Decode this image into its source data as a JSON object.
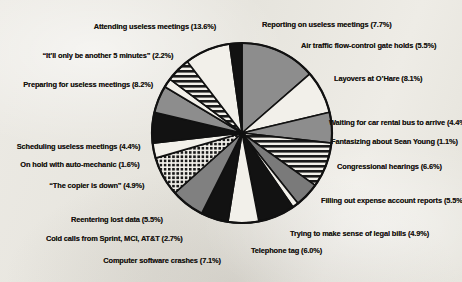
{
  "chart_data": {
    "type": "pie",
    "title": "",
    "subtitle": "",
    "xlabel": "",
    "ylabel": "",
    "legend_position": "radial-callout-labels",
    "grid": false,
    "units": "percent",
    "total": 100.0,
    "categories": [
      "Attending useless meetings",
      "Reporting on useless meetings",
      "Air traffic flow-control gate holds",
      "Layovers at O'Hare",
      "Waiting for car rental bus to arrive",
      "Fantasizing about Sean Young",
      "Congressional hearings",
      "Filling out expense account reports",
      "Trying to make sense of legal bills",
      "Telephone tag",
      "Computer software crashes",
      "Cold calls from Sprint, MCI, AT&T",
      "Reentering lost data",
      "“The copier is down”",
      "On hold with auto-mechanic",
      "Scheduling useless meetings",
      "Preparing for useless meetings",
      "“It’ll only be another 5 minutes”"
    ],
    "values": [
      13.6,
      7.7,
      5.5,
      8.1,
      4.4,
      1.1,
      6.6,
      5.5,
      4.9,
      6.0,
      7.1,
      2.7,
      5.5,
      4.9,
      1.6,
      4.4,
      8.2,
      2.2
    ],
    "slices": [
      {
        "label": "Attending useless meetings",
        "value": 13.6,
        "value_text": "13.6%",
        "fill": "gray",
        "color": "#8d8d8d"
      },
      {
        "label": "Reporting on useless meetings",
        "value": 7.7,
        "value_text": "7.7%",
        "fill": "white",
        "color": "#f2f0ea"
      },
      {
        "label": "Air traffic flow-control gate holds",
        "value": 5.5,
        "value_text": "5.5%",
        "fill": "gray",
        "color": "#8d8d8d"
      },
      {
        "label": "Layovers at O'Hare",
        "value": 8.1,
        "value_text": "8.1%",
        "fill": "hlines",
        "color": "#1a1a1a"
      },
      {
        "label": "Waiting for car rental bus to arrive",
        "value": 4.4,
        "value_text": "4.4%",
        "fill": "gray",
        "color": "#7a7a7a"
      },
      {
        "label": "Fantasizing about Sean Young",
        "value": 1.1,
        "value_text": "1.1%",
        "fill": "white",
        "color": "#f2f0ea"
      },
      {
        "label": "Congressional hearings",
        "value": 6.6,
        "value_text": "6.6%",
        "fill": "black",
        "color": "#121212"
      },
      {
        "label": "Filling out expense account reports",
        "value": 5.5,
        "value_text": "5.5%",
        "fill": "white",
        "color": "#f2f0ea"
      },
      {
        "label": "Trying to make sense of legal bills",
        "value": 4.9,
        "value_text": "4.9%",
        "fill": "black",
        "color": "#121212"
      },
      {
        "label": "Telephone tag",
        "value": 6.0,
        "value_text": "6.0%",
        "fill": "gray",
        "color": "#808080"
      },
      {
        "label": "Computer software crashes",
        "value": 7.1,
        "value_text": "7.1%",
        "fill": "dots",
        "color": "#1a1a1a"
      },
      {
        "label": "Cold calls from Sprint, MCI, AT&T",
        "value": 2.7,
        "value_text": "2.7%",
        "fill": "white",
        "color": "#f2f0ea"
      },
      {
        "label": "Reentering lost data",
        "value": 5.5,
        "value_text": "5.5%",
        "fill": "black",
        "color": "#121212"
      },
      {
        "label": "“The copier is down”",
        "value": 4.9,
        "value_text": "4.9%",
        "fill": "gray",
        "color": "#8d8d8d"
      },
      {
        "label": "On hold with auto-mechanic",
        "value": 1.6,
        "value_text": "1.6%",
        "fill": "white",
        "color": "#f2f0ea"
      },
      {
        "label": "Scheduling useless meetings",
        "value": 4.4,
        "value_text": "4.4%",
        "fill": "hlines",
        "color": "#1a1a1a"
      },
      {
        "label": "Preparing for useless meetings",
        "value": 8.2,
        "value_text": "8.2%",
        "fill": "white",
        "color": "#f2f0ea"
      },
      {
        "label": "“It’ll only be another 5 minutes”",
        "value": 2.2,
        "value_text": "2.2%",
        "fill": "black",
        "color": "#121212"
      }
    ]
  },
  "labels": {
    "left": [
      {
        "text": "Attending useless meetings (13.6%)",
        "x": 216,
        "y": 22
      },
      {
        "text": "“It’ll only be another 5 minutes” (2.2%)",
        "x": 173,
        "y": 51
      },
      {
        "text": "Preparing for useless meetings (8.2%)",
        "x": 153,
        "y": 80
      },
      {
        "text": "Scheduling useless meetings (4.4%)",
        "x": 140,
        "y": 142
      },
      {
        "text": "On hold with auto-mechanic (1.6%)",
        "x": 140,
        "y": 160
      },
      {
        "text": "“The copier is down” (4.9%)",
        "x": 144,
        "y": 181
      },
      {
        "text": "Reentering lost data (5.5%)",
        "x": 163,
        "y": 215
      },
      {
        "text": "Cold calls from Sprint, MCI, AT&T (2.7%)",
        "x": 183,
        "y": 234
      },
      {
        "text": "Computer software crashes (7.1%)",
        "x": 221,
        "y": 256
      }
    ],
    "right": [
      {
        "text": "Reporting on useless meetings (7.7%)",
        "x": 262,
        "y": 20
      },
      {
        "text": "Air traffic flow-control gate holds (5.5%)",
        "x": 301,
        "y": 41
      },
      {
        "text": "Layovers at O’Hare (8.1%)",
        "x": 334,
        "y": 74
      },
      {
        "text": "Waiting for car rental bus to arrive (4.4%)",
        "x": 329,
        "y": 118
      },
      {
        "text": "Fantasizing about Sean Young (1.1%)",
        "x": 331,
        "y": 137
      },
      {
        "text": "Congressional hearings (6.6%)",
        "x": 337,
        "y": 162
      },
      {
        "text": "Filling out expense account reports (5.5%)",
        "x": 321,
        "y": 196
      },
      {
        "text": "Trying to make sense of legal bills (4.9%)",
        "x": 290,
        "y": 229
      },
      {
        "text": "Telephone tag (6.0%)",
        "x": 251,
        "y": 246
      }
    ]
  },
  "geometry": {
    "center_x": 242,
    "center_y": 133,
    "radius": 90,
    "start_angle_deg": -90
  },
  "colors": {
    "background": "#e9e7e1",
    "ink": "#16130f",
    "slice_gray": "#8d8d8d",
    "slice_black": "#121212",
    "slice_white": "#f2f0ea"
  }
}
